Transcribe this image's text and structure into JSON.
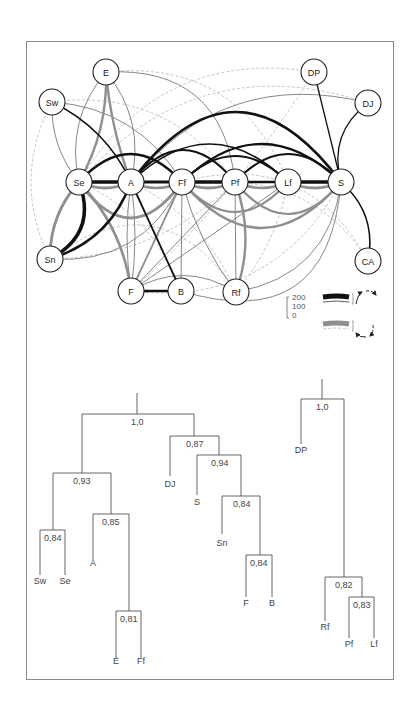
{
  "network": {
    "nodes": [
      {
        "id": "E",
        "label": "E",
        "x": 106,
        "y": 72
      },
      {
        "id": "Sw",
        "label": "Sw",
        "x": 52,
        "y": 102
      },
      {
        "id": "DP",
        "label": "DP",
        "x": 314,
        "y": 72
      },
      {
        "id": "DJ",
        "label": "DJ",
        "x": 368,
        "y": 103
      },
      {
        "id": "Se",
        "label": "Se",
        "x": 79,
        "y": 182
      },
      {
        "id": "A",
        "label": "A",
        "x": 131,
        "y": 182
      },
      {
        "id": "Ff",
        "label": "Ff",
        "x": 182,
        "y": 182
      },
      {
        "id": "Pf",
        "label": "Pf",
        "x": 235,
        "y": 182
      },
      {
        "id": "Lf",
        "label": "Lf",
        "x": 288,
        "y": 182
      },
      {
        "id": "S",
        "label": "S",
        "x": 341,
        "y": 182
      },
      {
        "id": "Sn",
        "label": "Sn",
        "x": 50,
        "y": 259
      },
      {
        "id": "CA",
        "label": "CA",
        "x": 368,
        "y": 261
      },
      {
        "id": "F",
        "label": "F",
        "x": 131,
        "y": 291
      },
      {
        "id": "B",
        "label": "B",
        "x": 181,
        "y": 291
      },
      {
        "id": "Rf",
        "label": "Rf",
        "x": 236,
        "y": 292
      }
    ],
    "colors": {
      "strong": "#111111",
      "gray": "#8f8f8f",
      "thin": "#6a6a6a",
      "dashed": "#b5b5b5"
    },
    "edges": [
      {
        "from": "Se",
        "to": "A",
        "style": "strong",
        "w": 3.5,
        "bend": 0
      },
      {
        "from": "A",
        "to": "Ff",
        "style": "strong",
        "w": 3.0,
        "bend": 0
      },
      {
        "from": "Ff",
        "to": "Pf",
        "style": "strong",
        "w": 3.5,
        "bend": 0
      },
      {
        "from": "Pf",
        "to": "Lf",
        "style": "strong",
        "w": 2.5,
        "bend": 0
      },
      {
        "from": "Lf",
        "to": "S",
        "style": "strong",
        "w": 3.5,
        "bend": 0
      },
      {
        "from": "Se",
        "to": "A",
        "style": "gray",
        "w": 3.0,
        "bend": 6
      },
      {
        "from": "A",
        "to": "Ff",
        "style": "gray",
        "w": 2.5,
        "bend": 6
      },
      {
        "from": "Ff",
        "to": "Pf",
        "style": "gray",
        "w": 3.0,
        "bend": 6
      },
      {
        "from": "Pf",
        "to": "Lf",
        "style": "gray",
        "w": 2.5,
        "bend": 6
      },
      {
        "from": "Lf",
        "to": "S",
        "style": "gray",
        "w": 3.0,
        "bend": 6
      },
      {
        "from": "A",
        "to": "S",
        "style": "strong",
        "w": 2.6,
        "bend": -70
      },
      {
        "from": "Se",
        "to": "Ff",
        "style": "strong",
        "w": 2.4,
        "bend": -28
      },
      {
        "from": "A",
        "to": "Pf",
        "style": "strong",
        "w": 2.2,
        "bend": -32
      },
      {
        "from": "Ff",
        "to": "S",
        "style": "strong",
        "w": 2.2,
        "bend": -38
      },
      {
        "from": "Ff",
        "to": "Lf",
        "style": "strong",
        "w": 2.0,
        "bend": -26
      },
      {
        "from": "Pf",
        "to": "S",
        "style": "strong",
        "w": 2.0,
        "bend": -28
      },
      {
        "from": "A",
        "to": "Lf",
        "style": "strong",
        "w": 1.6,
        "bend": -38
      },
      {
        "from": "Se",
        "to": "Sn",
        "style": "strong",
        "w": 3.5,
        "bend": -18
      },
      {
        "from": "A",
        "to": "Sn",
        "style": "strong",
        "w": 2.5,
        "bend": -14
      },
      {
        "from": "A",
        "to": "B",
        "style": "strong",
        "w": 1.8,
        "bend": 0
      },
      {
        "from": "F",
        "to": "B",
        "style": "strong",
        "w": 2.6,
        "bend": 0
      },
      {
        "from": "Sw",
        "to": "A",
        "style": "strong",
        "w": 1.4,
        "bend": -10
      },
      {
        "from": "DP",
        "to": "S",
        "style": "strong",
        "w": 1.3,
        "bend": 0
      },
      {
        "from": "DJ",
        "to": "S",
        "style": "strong",
        "w": 1.3,
        "bend": 14
      },
      {
        "from": "S",
        "to": "CA",
        "style": "strong",
        "w": 1.6,
        "bend": -12
      },
      {
        "from": "Se",
        "to": "Sn",
        "style": "gray",
        "w": 2.8,
        "bend": 8
      },
      {
        "from": "Se",
        "to": "F",
        "style": "gray",
        "w": 2.6,
        "bend": -10
      },
      {
        "from": "E",
        "to": "Se",
        "style": "gray",
        "w": 2.4,
        "bend": -8
      },
      {
        "from": "E",
        "to": "A",
        "style": "gray",
        "w": 2.4,
        "bend": 4
      },
      {
        "from": "Se",
        "to": "Ff",
        "style": "gray",
        "w": 3.0,
        "bend": 36
      },
      {
        "from": "Ff",
        "to": "S",
        "style": "gray",
        "w": 2.6,
        "bend": 46
      },
      {
        "from": "Ff",
        "to": "Lf",
        "style": "gray",
        "w": 2.2,
        "bend": 30
      },
      {
        "from": "Pf",
        "to": "S",
        "style": "gray",
        "w": 2.2,
        "bend": 32
      },
      {
        "from": "Pf",
        "to": "Rf",
        "style": "gray",
        "w": 2.4,
        "bend": -10
      },
      {
        "from": "Ff",
        "to": "F",
        "style": "gray",
        "w": 1.8,
        "bend": 0
      },
      {
        "from": "E",
        "to": "Se",
        "style": "thin",
        "w": 0.8,
        "bend": 14
      },
      {
        "from": "E",
        "to": "A",
        "style": "thin",
        "w": 0.8,
        "bend": -14
      },
      {
        "from": "E",
        "to": "Pf",
        "style": "thin",
        "w": 0.8,
        "bend": -40
      },
      {
        "from": "Sw",
        "to": "Se",
        "style": "thin",
        "w": 0.8,
        "bend": 8
      },
      {
        "from": "Sw",
        "to": "Ff",
        "style": "thin",
        "w": 0.8,
        "bend": -20
      },
      {
        "from": "DJ",
        "to": "A",
        "style": "thin",
        "w": 0.8,
        "bend": 40
      },
      {
        "from": "Sn",
        "to": "Ff",
        "style": "thin",
        "w": 0.8,
        "bend": 26
      },
      {
        "from": "A",
        "to": "F",
        "style": "thin",
        "w": 0.8,
        "bend": 4
      },
      {
        "from": "A",
        "to": "F",
        "style": "thin",
        "w": 0.8,
        "bend": -4
      },
      {
        "from": "Ff",
        "to": "B",
        "style": "thin",
        "w": 0.8,
        "bend": 0
      },
      {
        "from": "F",
        "to": "Pf",
        "style": "thin",
        "w": 0.8,
        "bend": 0
      },
      {
        "from": "F",
        "to": "Lf",
        "style": "thin",
        "w": 0.8,
        "bend": 0
      },
      {
        "from": "F",
        "to": "Rf",
        "style": "thin",
        "w": 0.8,
        "bend": -16
      },
      {
        "from": "Ff",
        "to": "Rf",
        "style": "thin",
        "w": 0.8,
        "bend": 6
      },
      {
        "from": "Pf",
        "to": "Rf",
        "style": "thin",
        "w": 0.8,
        "bend": 0
      },
      {
        "from": "Rf",
        "to": "S",
        "style": "thin",
        "w": 0.8,
        "bend": 28
      },
      {
        "from": "B",
        "to": "S",
        "style": "thin",
        "w": 0.8,
        "bend": 60
      },
      {
        "from": "E",
        "to": "Lf",
        "style": "dashed",
        "w": 0.8,
        "bend": -40
      },
      {
        "from": "Sw",
        "to": "Sn",
        "style": "dashed",
        "w": 0.8,
        "bend": 20
      },
      {
        "from": "Sw",
        "to": "Pf",
        "style": "dashed",
        "w": 0.8,
        "bend": -30
      },
      {
        "from": "DP",
        "to": "F",
        "style": "dashed",
        "w": 0.8,
        "bend": -10
      },
      {
        "from": "DP",
        "to": "Se",
        "style": "dashed",
        "w": 0.8,
        "bend": 44
      },
      {
        "from": "DJ",
        "to": "Se",
        "style": "dashed",
        "w": 0.8,
        "bend": 50
      },
      {
        "from": "Sn",
        "to": "Rf",
        "style": "dashed",
        "w": 0.8,
        "bend": -50
      },
      {
        "from": "Sn",
        "to": "Pf",
        "style": "dashed",
        "w": 0.8,
        "bend": 20
      },
      {
        "from": "Se",
        "to": "B",
        "style": "dashed",
        "w": 0.8,
        "bend": -16
      },
      {
        "from": "A",
        "to": "Rf",
        "style": "dashed",
        "w": 0.8,
        "bend": -14
      },
      {
        "from": "Ff",
        "to": "CA",
        "style": "dashed",
        "w": 0.8,
        "bend": -40
      },
      {
        "from": "Lf",
        "to": "Rf",
        "style": "dashed",
        "w": 0.8,
        "bend": -8
      },
      {
        "from": "Pf",
        "to": "CA",
        "style": "dashed",
        "w": 0.8,
        "bend": -20
      },
      {
        "from": "F",
        "to": "S",
        "style": "dashed",
        "w": 0.8,
        "bend": 40
      }
    ],
    "legend": {
      "ticks": [
        "200",
        "100",
        "0"
      ]
    }
  },
  "dendrograms": [
    {
      "id": "left",
      "root": {
        "x": 137,
        "y_top": 395,
        "y_bar": 414
      },
      "labels": {
        "n10": "1,0",
        "n087": "0,87",
        "n093": "0,93",
        "n094": "0,94",
        "n085": "0,85",
        "n084a": "0,84",
        "n084b": "0,84",
        "n084c": "0,84",
        "n081": "0,81"
      },
      "leaves": [
        "Sw",
        "Se",
        "A",
        "E",
        "Ff",
        "DJ",
        "S",
        "Sn",
        "F",
        "B"
      ]
    },
    {
      "id": "right",
      "labels": {
        "n10": "1,0",
        "n082": "0,82",
        "n083": "0,83"
      },
      "leaves": [
        "DP",
        "Rf",
        "Pf",
        "Lf"
      ]
    }
  ]
}
